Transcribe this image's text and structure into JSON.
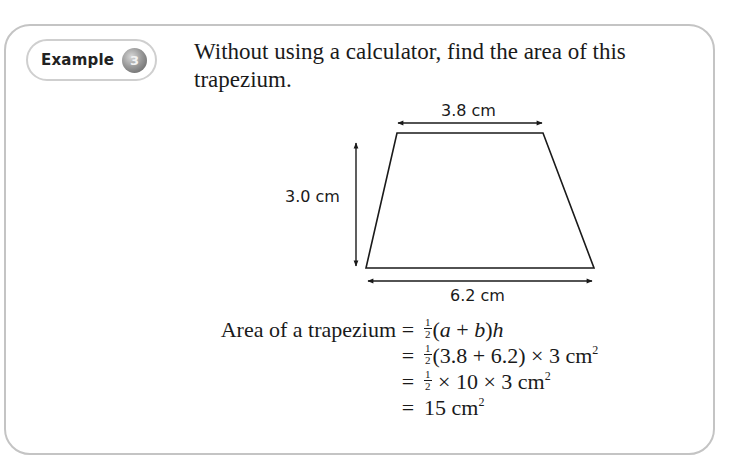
{
  "badge": {
    "label": "Example",
    "number": "3"
  },
  "question": {
    "text": "Without using a calculator, find the area of this trapezium."
  },
  "figure": {
    "shape": "trapezium",
    "top_label": "3.8 cm",
    "height_label": "3.0 cm",
    "bottom_label": "6.2 cm",
    "line_color": "#1a1a1a"
  },
  "working": {
    "lhs": "Area of a trapezium",
    "equals": "=",
    "half_num": "1",
    "half_den": "2",
    "row1": {
      "a": "a",
      "plus": " + ",
      "b": "b",
      "h": "h"
    },
    "row2": {
      "expr": "(3.8 + 6.2) × 3 cm",
      "exp": "2"
    },
    "row3": {
      "expr": " × 10 × 3 cm",
      "exp": "2"
    },
    "row4": {
      "expr": "15 cm",
      "exp": "2"
    }
  },
  "colors": {
    "border": "#c4c4c4",
    "badge_circle": "#8a8a8a",
    "text": "#1a1a1a"
  }
}
